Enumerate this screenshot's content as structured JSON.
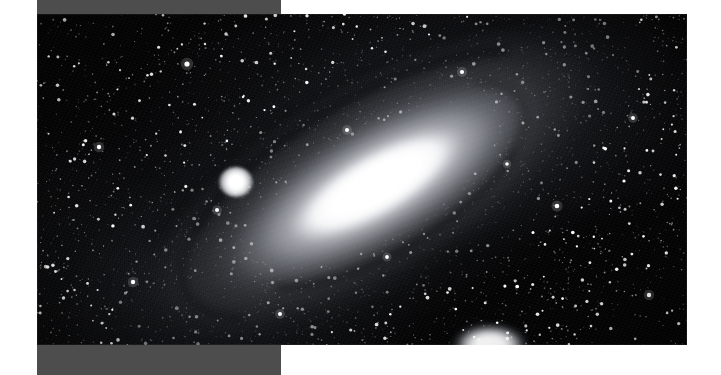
{
  "page": {
    "background_color": "#ffffff",
    "width": 721,
    "height": 375
  },
  "mount": {
    "band_color": "#4d4d4d",
    "top_band_label": "top-mount-band",
    "bottom_band_label": "bottom-mount-band"
  },
  "plate": {
    "label": "astrophotograph-plate",
    "background_color": "#050506",
    "subject": "Andromeda Galaxy",
    "orientation_degrees": -30
  },
  "objects": {
    "main_galaxy": {
      "name": "Andromeda Galaxy",
      "nucleus_label": "galaxy-nucleus",
      "bulge_label": "galaxy-bulge",
      "halo_label": "galaxy-halo",
      "dust_lane_label": "dust-lane"
    },
    "companion_upper": {
      "name": "companion-galaxy-m32"
    },
    "companion_lower": {
      "name": "companion-galaxy-m110"
    }
  },
  "starfield": {
    "label": "star-field",
    "dim_layer_label": "dim-stars",
    "bright_layer_label": "bright-stars"
  },
  "chart_data": {
    "type": "scatter",
    "xlabel": "",
    "ylabel": ""
  }
}
